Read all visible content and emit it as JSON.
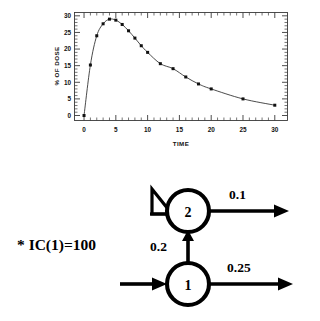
{
  "chart_data": {
    "type": "line",
    "title": "",
    "xlabel": "TIME",
    "ylabel": "% OF DOSE",
    "xlim": [
      -1.5,
      32
    ],
    "ylim": [
      -1.5,
      31
    ],
    "xticks": [
      0,
      5,
      10,
      15,
      20,
      25,
      30
    ],
    "yticks": [
      0,
      5,
      10,
      15,
      20,
      25,
      30
    ],
    "xtick_labels": [
      "0",
      "5",
      "10",
      "15",
      "20",
      "25",
      "30"
    ],
    "ytick_labels": [
      "0",
      "5",
      "10",
      "15",
      "20",
      "25",
      "30"
    ],
    "minor_tick_step": 1,
    "grid": false,
    "legend": "none",
    "marker": "square",
    "series": [
      {
        "name": "% of dose in compartment 2",
        "x": [
          0,
          1,
          2,
          3,
          4,
          5,
          6,
          7,
          8,
          9,
          10,
          12,
          14,
          16,
          18,
          20,
          25,
          30
        ],
        "y": [
          0,
          15.2,
          24.0,
          27.6,
          29.0,
          28.7,
          27.4,
          25.5,
          23.3,
          21.0,
          19.0,
          15.6,
          14.1,
          11.6,
          9.5,
          8.0,
          5.0,
          3.1
        ]
      }
    ]
  },
  "chart": {
    "ylabel": "% OF DOSE",
    "xlabel": "TIME"
  },
  "diagram": {
    "type": "two-compartment-model",
    "note": "* IC(1)=100",
    "compartments": [
      {
        "id": "1",
        "label": "1"
      },
      {
        "id": "2",
        "label": "2"
      }
    ],
    "rates": {
      "one_to_two": "0.2",
      "two_out": "0.1",
      "one_out": "0.25"
    },
    "input_arrow_into": "1",
    "delay_element_on": "2"
  }
}
